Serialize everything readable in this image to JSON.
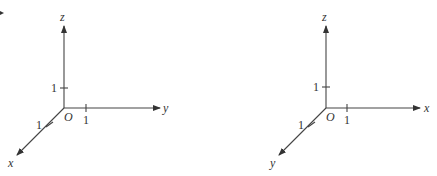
{
  "figures": [
    {
      "name": "left-coordinate-system",
      "origin_label": "O",
      "axes": {
        "vertical": {
          "label": "z",
          "tick_label": "1"
        },
        "horizontal": {
          "label": "y",
          "tick_label": "1"
        },
        "oblique": {
          "label": "x",
          "tick_label": "1"
        }
      }
    },
    {
      "name": "right-coordinate-system",
      "origin_label": "O",
      "axes": {
        "vertical": {
          "label": "z",
          "tick_label": "1"
        },
        "horizontal": {
          "label": "x",
          "tick_label": "1"
        },
        "oblique": {
          "label": "y",
          "tick_label": "1"
        }
      }
    }
  ],
  "colors": {
    "line": "#444444",
    "text": "#333333",
    "background": "#ffffff"
  }
}
